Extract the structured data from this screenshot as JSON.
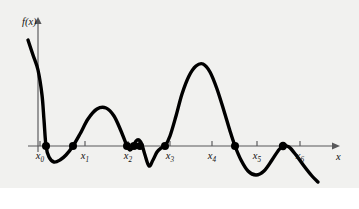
{
  "figure": {
    "background_color": "#f1f1ef",
    "page_color": "#ffffff",
    "curve_color": "#000000",
    "axis_color": "#58585a",
    "plate": {
      "x": 0,
      "y": 0,
      "width": 359,
      "height": 188
    }
  },
  "labels": {
    "y_axis": "f(x)",
    "x_axis": "x",
    "ticks": [
      {
        "name": "x0",
        "base": "x",
        "sub": "0"
      },
      {
        "name": "x1",
        "base": "x",
        "sub": "1"
      },
      {
        "name": "x2",
        "base": "x",
        "sub": "2"
      },
      {
        "name": "x3",
        "base": "x",
        "sub": "3"
      },
      {
        "name": "x4",
        "base": "x",
        "sub": "4"
      },
      {
        "name": "x5",
        "base": "x",
        "sub": "5"
      },
      {
        "name": "x6",
        "base": "x",
        "sub": "6"
      }
    ]
  },
  "chart_data": {
    "type": "line",
    "title": "",
    "xlabel": "x",
    "ylabel": "f(x)",
    "grid": false,
    "legend": "none",
    "axes": {
      "x_axis_y_px": 146,
      "y_axis_x_px": 38,
      "x_axis_start_px": 28,
      "x_axis_end_px": 338,
      "y_axis_top_px": 18,
      "y_axis_bottom_px": 152
    },
    "tick_positions_px": [
      40,
      85,
      128,
      170,
      212,
      257,
      300
    ],
    "tick_label_positions_px": [
      40,
      85,
      128,
      170,
      212,
      257,
      300
    ],
    "roots_px": [
      {
        "label": "x0",
        "x": 46,
        "y": 146,
        "type": "crossing"
      },
      {
        "label": "x1",
        "x": 73,
        "y": 146,
        "type": "crossing"
      },
      {
        "label": "x2",
        "x": 127,
        "y": 146,
        "type": "crossing"
      },
      {
        "label": "x2b",
        "x": 134,
        "y": 146,
        "type": "crossing"
      },
      {
        "label": "x2c",
        "x": 140,
        "y": 146,
        "type": "crossing"
      },
      {
        "label": "x3",
        "x": 165,
        "y": 146,
        "type": "crossing"
      },
      {
        "label": "x5",
        "x": 235,
        "y": 146,
        "type": "crossing"
      },
      {
        "label": "x6",
        "x": 283,
        "y": 146,
        "type": "tangent"
      }
    ],
    "curve_points_px": [
      [
        28,
        40
      ],
      [
        33,
        55
      ],
      [
        38,
        70
      ],
      [
        42,
        95
      ],
      [
        44,
        120
      ],
      [
        46,
        146
      ],
      [
        49,
        157
      ],
      [
        54,
        162
      ],
      [
        60,
        160
      ],
      [
        66,
        155
      ],
      [
        73,
        146
      ],
      [
        80,
        134
      ],
      [
        88,
        119
      ],
      [
        97,
        109
      ],
      [
        106,
        108
      ],
      [
        114,
        116
      ],
      [
        121,
        131
      ],
      [
        127,
        146
      ],
      [
        130,
        150
      ],
      [
        133,
        147
      ],
      [
        136,
        141
      ],
      [
        139,
        140
      ],
      [
        142,
        145
      ],
      [
        145,
        155
      ],
      [
        149,
        166
      ],
      [
        153,
        160
      ],
      [
        157,
        152
      ],
      [
        161,
        148
      ],
      [
        165,
        146
      ],
      [
        170,
        136
      ],
      [
        176,
        116
      ],
      [
        182,
        94
      ],
      [
        189,
        76
      ],
      [
        196,
        66
      ],
      [
        203,
        64
      ],
      [
        210,
        72
      ],
      [
        217,
        89
      ],
      [
        224,
        111
      ],
      [
        230,
        131
      ],
      [
        235,
        146
      ],
      [
        241,
        160
      ],
      [
        248,
        171
      ],
      [
        256,
        175
      ],
      [
        264,
        171
      ],
      [
        272,
        160
      ],
      [
        278,
        151
      ],
      [
        283,
        146
      ],
      [
        289,
        147
      ],
      [
        296,
        155
      ],
      [
        304,
        166
      ],
      [
        312,
        176
      ],
      [
        318,
        182
      ]
    ],
    "curve_description": "Smooth continuous function f(x) with eight marked zero points; a sharply descending branch at the left, three well-separated simple roots, a cluster of closely-spaced roots near x2, a tall interior maximum between x3 and x4, a deep minimum near x5, and a tangential zero near x6 before descending again."
  }
}
